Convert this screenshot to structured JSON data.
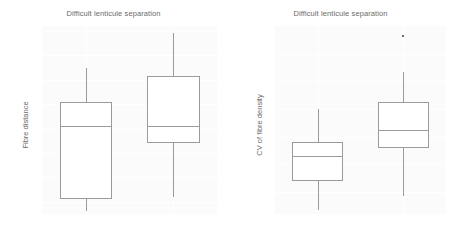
{
  "chart_data": [
    {
      "type": "box",
      "panel": "left",
      "title": "Difficult lenticule separation",
      "xlabel": "",
      "ylabel": "Fibre distance",
      "categories": [
        "Yes",
        "No"
      ],
      "ylim": [
        11.75,
        15.6
      ],
      "yticks": [
        12.0,
        12.5,
        13.0,
        13.5,
        14.0,
        14.5,
        15.0,
        15.5
      ],
      "ytick_labels": [
        "12.0",
        "12.5",
        "13.0",
        "13.5",
        "14.0",
        "14.5",
        "15.0",
        "15.5"
      ],
      "grid": true,
      "legend": "none",
      "boxes": [
        {
          "category": "Yes",
          "whisker_low": 11.82,
          "q1": 12.05,
          "median": 13.55,
          "q3": 14.05,
          "whisker_high": 14.75,
          "outliers": []
        },
        {
          "category": "No",
          "whisker_low": 12.1,
          "q1": 13.2,
          "median": 13.55,
          "q3": 14.57,
          "whisker_high": 15.45,
          "outliers": []
        }
      ]
    },
    {
      "type": "box",
      "panel": "right",
      "title": "Difficult lenticule separation",
      "xlabel": "",
      "ylabel": "CV of fibre density",
      "categories": [
        "Yes",
        "No"
      ],
      "ylim": [
        44,
        180
      ],
      "yticks": [
        60,
        80,
        100,
        120,
        140,
        160
      ],
      "ytick_labels": [
        "60",
        "80",
        "100",
        "120",
        "140",
        "160"
      ],
      "grid": true,
      "legend": "none",
      "boxes": [
        {
          "category": "Yes",
          "whisker_low": 47,
          "q1": 68,
          "median": 86,
          "q3": 96,
          "whisker_high": 120,
          "outliers": []
        },
        {
          "category": "No",
          "whisker_low": 57,
          "q1": 92,
          "median": 105,
          "q3": 125,
          "whisker_high": 147,
          "outliers": [
            173
          ]
        }
      ]
    }
  ]
}
